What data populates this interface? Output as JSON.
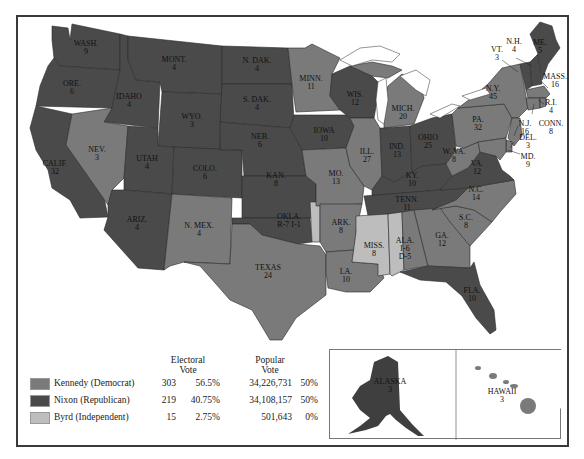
{
  "colors": {
    "kennedy": "#7a7a7a",
    "nixon": "#4a4a4a",
    "byrd": "#bdbdbd",
    "border": "#2a2a2a",
    "water": "#ffffff"
  },
  "legend": {
    "header_electoral": "Electoral",
    "header_electoral_2": "Vote",
    "header_popular": "Popular",
    "header_popular_2": "Vote",
    "rows": [
      {
        "candidate": "Kennedy (Democrat)",
        "electoral_votes": "303",
        "electoral_pct": "56.5%",
        "popular_votes": "34,226,731",
        "popular_pct": "50%"
      },
      {
        "candidate": "Nixon (Republican)",
        "electoral_votes": "219",
        "electoral_pct": "40.75%",
        "popular_votes": "34,108,157",
        "popular_pct": "50%"
      },
      {
        "candidate": "Byrd (Independent)",
        "electoral_votes": "15",
        "electoral_pct": "2.75%",
        "popular_votes": "501,643",
        "popular_pct": "0%"
      }
    ]
  },
  "states": [
    {
      "name": "WASH.",
      "ev": "9",
      "winner": "nixon"
    },
    {
      "name": "ORE.",
      "ev": "6",
      "winner": "nixon"
    },
    {
      "name": "CALIF.",
      "ev": "32",
      "winner": "nixon"
    },
    {
      "name": "IDAHO",
      "ev": "4",
      "winner": "nixon"
    },
    {
      "name": "NEV.",
      "ev": "3",
      "winner": "kennedy"
    },
    {
      "name": "MONT.",
      "ev": "4",
      "winner": "nixon"
    },
    {
      "name": "WYO.",
      "ev": "3",
      "winner": "nixon"
    },
    {
      "name": "UTAH",
      "ev": "4",
      "winner": "nixon"
    },
    {
      "name": "ARIZ.",
      "ev": "4",
      "winner": "nixon"
    },
    {
      "name": "COLO.",
      "ev": "6",
      "winner": "nixon"
    },
    {
      "name": "N. MEX.",
      "ev": "4",
      "winner": "kennedy"
    },
    {
      "name": "N. DAK.",
      "ev": "4",
      "winner": "nixon"
    },
    {
      "name": "S. DAK.",
      "ev": "4",
      "winner": "nixon"
    },
    {
      "name": "NEB.",
      "ev": "6",
      "winner": "nixon"
    },
    {
      "name": "KAN.",
      "ev": "8",
      "winner": "nixon"
    },
    {
      "name": "OKLA.",
      "ev": "R-7  I-1",
      "winner": "nixon"
    },
    {
      "name": "TEXAS",
      "ev": "24",
      "winner": "kennedy"
    },
    {
      "name": "MINN.",
      "ev": "11",
      "winner": "kennedy"
    },
    {
      "name": "IOWA",
      "ev": "10",
      "winner": "nixon"
    },
    {
      "name": "MO.",
      "ev": "13",
      "winner": "kennedy"
    },
    {
      "name": "ARK.",
      "ev": "8",
      "winner": "kennedy"
    },
    {
      "name": "LA.",
      "ev": "10",
      "winner": "kennedy"
    },
    {
      "name": "WIS.",
      "ev": "12",
      "winner": "nixon"
    },
    {
      "name": "ILL.",
      "ev": "27",
      "winner": "kennedy"
    },
    {
      "name": "MICH.",
      "ev": "20",
      "winner": "kennedy"
    },
    {
      "name": "IND.",
      "ev": "13",
      "winner": "nixon"
    },
    {
      "name": "OHIO",
      "ev": "25",
      "winner": "nixon"
    },
    {
      "name": "KY.",
      "ev": "10",
      "winner": "nixon"
    },
    {
      "name": "TENN.",
      "ev": "11",
      "winner": "nixon"
    },
    {
      "name": "MISS.",
      "ev": "8",
      "winner": "byrd"
    },
    {
      "name": "ALA.",
      "ev": "I-6  D-5",
      "winner": "split"
    },
    {
      "name": "GA.",
      "ev": "12",
      "winner": "kennedy"
    },
    {
      "name": "FLA.",
      "ev": "10",
      "winner": "nixon"
    },
    {
      "name": "S.C.",
      "ev": "8",
      "winner": "kennedy"
    },
    {
      "name": "N.C.",
      "ev": "14",
      "winner": "kennedy"
    },
    {
      "name": "VA.",
      "ev": "12",
      "winner": "nixon"
    },
    {
      "name": "W. VA.",
      "ev": "8",
      "winner": "kennedy"
    },
    {
      "name": "PA.",
      "ev": "32",
      "winner": "kennedy"
    },
    {
      "name": "N.Y.",
      "ev": "45",
      "winner": "kennedy"
    },
    {
      "name": "VT.",
      "ev": "3",
      "winner": "nixon"
    },
    {
      "name": "N.H.",
      "ev": "4",
      "winner": "nixon"
    },
    {
      "name": "ME.",
      "ev": "5",
      "winner": "nixon"
    },
    {
      "name": "MASS.",
      "ev": "16",
      "winner": "kennedy"
    },
    {
      "name": "R.I.",
      "ev": "4",
      "winner": "kennedy"
    },
    {
      "name": "CONN.",
      "ev": "8",
      "winner": "kennedy"
    },
    {
      "name": "N.J.",
      "ev": "16",
      "winner": "kennedy"
    },
    {
      "name": "DEL.",
      "ev": "3",
      "winner": "kennedy"
    },
    {
      "name": "MD.",
      "ev": "9",
      "winner": "kennedy"
    },
    {
      "name": "ALASKA",
      "ev": "3",
      "winner": "nixon"
    },
    {
      "name": "HAWAII",
      "ev": "3",
      "winner": "kennedy"
    }
  ]
}
